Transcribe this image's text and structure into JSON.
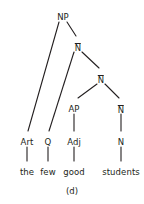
{
  "figure": {
    "caption": "(d)",
    "caption_x": 72,
    "caption_y": 186,
    "width": 144,
    "height": 204,
    "background_color": "#ffffff",
    "ink_color": "#231f20",
    "type": "syntax-tree"
  },
  "nodes": [
    {
      "id": "np",
      "label": "NP",
      "bar": false,
      "x": 63,
      "y": 12
    },
    {
      "id": "nbar1",
      "label": "N",
      "bar": true,
      "x": 78,
      "y": 42
    },
    {
      "id": "nbar2",
      "label": "N",
      "bar": true,
      "x": 101,
      "y": 74
    },
    {
      "id": "ap",
      "label": "AP",
      "bar": false,
      "x": 74,
      "y": 104
    },
    {
      "id": "nbar3",
      "label": "N",
      "bar": true,
      "x": 121,
      "y": 104
    },
    {
      "id": "art",
      "label": "Art",
      "bar": false,
      "x": 27,
      "y": 137
    },
    {
      "id": "q",
      "label": "Q",
      "bar": false,
      "x": 48,
      "y": 137
    },
    {
      "id": "adj",
      "label": "Adj",
      "bar": false,
      "x": 74,
      "y": 137
    },
    {
      "id": "n",
      "label": "N",
      "bar": false,
      "x": 121,
      "y": 137
    }
  ],
  "words": [
    {
      "id": "the",
      "label": "the",
      "x": 27,
      "y": 167
    },
    {
      "id": "few",
      "label": "few",
      "x": 48,
      "y": 167
    },
    {
      "id": "good",
      "label": "good",
      "x": 74,
      "y": 167
    },
    {
      "id": "students",
      "label": "students",
      "x": 121,
      "y": 167
    }
  ],
  "edges": [
    {
      "from": "np",
      "to": "art",
      "x1": 59,
      "y1": 22,
      "x2": 28,
      "y2": 131
    },
    {
      "from": "np",
      "to": "nbar1",
      "x1": 67,
      "y1": 22,
      "x2": 76,
      "y2": 36
    },
    {
      "from": "nbar1",
      "to": "q",
      "x1": 74,
      "y1": 52,
      "x2": 49,
      "y2": 131
    },
    {
      "from": "nbar1",
      "to": "nbar2",
      "x1": 82,
      "y1": 52,
      "x2": 99,
      "y2": 68
    },
    {
      "from": "nbar2",
      "to": "ap",
      "x1": 97,
      "y1": 84,
      "x2": 78,
      "y2": 98
    },
    {
      "from": "nbar2",
      "to": "nbar3",
      "x1": 105,
      "y1": 84,
      "x2": 119,
      "y2": 98
    },
    {
      "from": "ap",
      "to": "adj",
      "x1": 74,
      "y1": 114,
      "x2": 74,
      "y2": 131
    },
    {
      "from": "nbar3",
      "to": "n",
      "x1": 121,
      "y1": 114,
      "x2": 121,
      "y2": 131
    },
    {
      "from": "art",
      "to": "the",
      "x1": 27,
      "y1": 147,
      "x2": 27,
      "y2": 161
    },
    {
      "from": "q",
      "to": "few",
      "x1": 48,
      "y1": 147,
      "x2": 48,
      "y2": 161
    },
    {
      "from": "adj",
      "to": "good",
      "x1": 74,
      "y1": 147,
      "x2": 74,
      "y2": 161
    },
    {
      "from": "n",
      "to": "students",
      "x1": 121,
      "y1": 147,
      "x2": 121,
      "y2": 161
    }
  ]
}
